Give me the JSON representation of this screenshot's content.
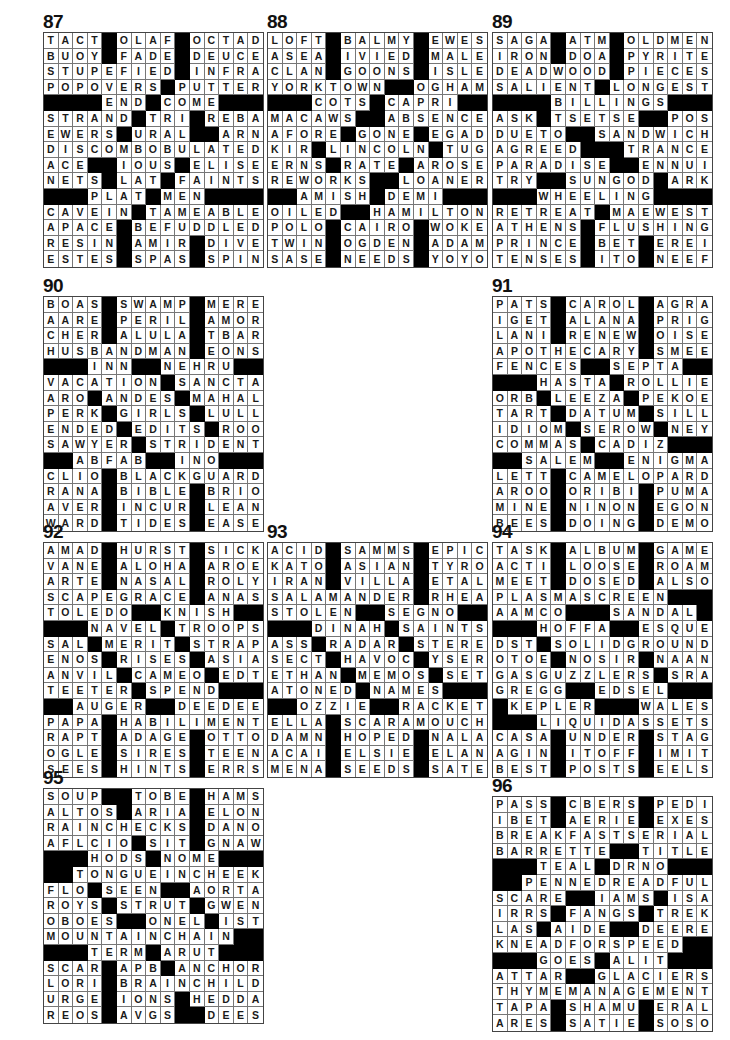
{
  "puzzles": [
    {
      "number": "87",
      "x": 43,
      "y": 12,
      "rows": [
        "TACT#OLAF#OCTAD",
        "BUOY#FADE#DEUCE",
        "STUPEFIED#INFRA",
        "POPOVERS#PUTTER",
        "####END#COME####",
        "STRAND#TRI#REBA",
        "EWERS#URAL##ARN",
        "DISCOMBOBULATED",
        "ACE##IOUS#ELISE",
        "NETS#LAT#FAINTS",
        "###PLAT#MEN####",
        "CAVEIN#TAMEABLE",
        "APACE#BEFUDDLED",
        "RESIN#AMIR#DIVE",
        "ESTES#SPAS#SPIN"
      ]
    },
    {
      "number": "88",
      "x": 267,
      "y": 12,
      "rows": [
        "LOFT#BALMY#EWES",
        "ASEA#IVIED#MALE",
        "CLAN#GOONS#ISLE",
        "YORKTOWN##OGHAM",
        "###COTS#CAPRI##",
        "MACAWS##ABSENCE",
        "AFORE#GONE#EGAD",
        "KIR#LINCOLN#TUG",
        "ERNS#RATE#AROSE",
        "REWORKS##LOANER",
        "##AMISH#DEMI###",
        "OILED##HAMILTON",
        "POLO#CAIRO#WOKE",
        "TWIN#OGDEN#ADAM",
        "SASE#NEEDS#YOYO"
      ]
    },
    {
      "number": "89",
      "x": 492,
      "y": 12,
      "rows": [
        "SAGA#ATM#OLDMEN",
        "IRON#DOA#PYRITE",
        "DEADWOOD#PIECES",
        "SALIENT#LONGEST",
        "####BILLINGS###",
        "ASK#TSETSE##POS",
        "DUETO##SANDWICH",
        "AGREED###TRANCE",
        "PARADISE##ENNUI",
        "TRY##SUNGOD#ARK",
        "###WHEELING####",
        "RETREAT#MAEWEST",
        "ATHENS#FLUSHING",
        "PRINCE#BET#EREI",
        "TENSES#ITO#NEEF"
      ]
    },
    {
      "number": "90",
      "x": 43,
      "y": 276,
      "rows": [
        "BOAS#SWAMP#MERE",
        "AARE#PERIL#AMOR",
        "CHER#ALULA#TBAR",
        "HUSBANDMAN#EONS",
        "###INN##NEHRU##",
        "VACATION#SANCTA",
        "ARO#ANDES#MAHAL",
        "PERK#GIRLS#LULL",
        "ENDED#EDITS#ROO",
        "SAWYER#STRIDENT",
        "##ABFAB##INO####",
        "CLIO#BLACKGUARD",
        "RANA#BIBLE#BRIO",
        "AVER#INCUR#LEAN",
        "WARD#TIDES#EASE"
      ]
    },
    {
      "number": "91",
      "x": 492,
      "y": 276,
      "rows": [
        "PATS#CAROL#AGRA",
        "IGET#ALANA#PRIG",
        "LANI#RENEW#OISE",
        "APOTHECARY#SMEE",
        "FENCES##SEPTA##",
        "###HASTA#ROLLIE",
        "ORB#LEEZA#PEKOE",
        "TART#DATUM#SILL",
        "IDIOM#SEROW#NEY",
        "COMMAS#CADIZ###",
        "##SALEM##ENIGMA",
        "LETT#CAMELOPARD",
        "AROO#ORIBI#PUMA",
        "MINE#NINON#EGON",
        "BEES#DOING#DEMO"
      ]
    },
    {
      "number": "92",
      "x": 43,
      "y": 522,
      "rows": [
        "AMAD#HURST#SICK",
        "VANE#ALOHA#AROE",
        "ARTE#NASAL#ROLY",
        "SCAPEGRACE#ANAS",
        "TOLEDO##KNISH##",
        "###NAVEL#TROOPS",
        "SAL#MERIT#STRAP",
        "ENOS#RISES#ASIA",
        "ANVIL#CAMEO#EDT",
        "TEETER#SPEND###",
        "##AUGER##DEEDEE",
        "PAPA#HABILIMENT",
        "RAPT#ADAGE#OTTO",
        "OGLE#SIRES#TEEN",
        "SEES#HINTS#ERRS"
      ]
    },
    {
      "number": "93",
      "x": 267,
      "y": 522,
      "rows": [
        "ACID#SAMMS#EPIC",
        "KATO#ASIAN#TYRO",
        "IRAN#VILLA#ETAL",
        "SALAMANDER#RHEA",
        "STOLEN##SEGNO##",
        "###DINAH#SAINTS",
        "ASS#RADAR#STERE",
        "SECT#HAVOC#YSER",
        "ETHAN#MEMOS#SET",
        "ATONED#NAMES###",
        "##OZZIE##RACKET",
        "ELLA#SCARAMOUCH",
        "DAMN#HOPED#NALA",
        "ACAI#ELSIE#ELAN",
        "MENA#SEEDS#SATE"
      ]
    },
    {
      "number": "94",
      "x": 492,
      "y": 522,
      "rows": [
        "TASK#ALBUM#GAME",
        "ACTI#LOOSE#ROAM",
        "MEET#DOSED#ALSO",
        "PLASMASCREEN###",
        "AAMCO###SANDAL#",
        "###HOFFA##ESQUE",
        "DST#SOLIDGROUND",
        "OTOE#NOSIR#NAAN",
        "GASGUZZLERS#SRA",
        "GREGG##EDSEL###",
        "#KEPLER###WALES",
        "###LIQUIDASSETS",
        "CASA#UNDER#STAG",
        "AGIN#ITOFF#IMIT",
        "BEST#POSTS#EELS"
      ]
    },
    {
      "number": "95",
      "x": 43,
      "y": 768,
      "rows": [
        "SOUP##TOBE#HAMS",
        "ALTOS#ARIA#ELON",
        "RAINCHECKS#DANO",
        "AFLCIO#SIT#GNAW",
        "###HODS#NOME###",
        "##TONGUEINCHEEK",
        "FLO#SEEN##AORTA",
        "ROYS#STRUT#GWEN",
        "OBOES##ONEL#IST",
        "MOUNTAINCHAIN##",
        "###TERM#ARUT###",
        "SCAR#APB#ANCHOR",
        "LORI#BRAINCHILD",
        "URGE#IONS#HEDDA",
        "REOS#AVGS##DEES"
      ]
    },
    {
      "number": "96",
      "x": 492,
      "y": 776,
      "rows": [
        "PASS#CBERS#PEDI",
        "IBET#AERIE#EXES",
        "BREAKFASTSERIAL",
        "BARRETTE##TITLE",
        "###TEAL#DRNO###",
        "##PENNEDREADFUL",
        "SCARE##IAMS#ISA",
        "IRRS#FANGS#TREK",
        "LAS#AIDE##DEERE",
        "KNEADFORSPEED##",
        "###GOES#ALIT###",
        "ATTAR##GLACIERS",
        "THYMEMANAGEMENT",
        "TAPA#SHAMU#ERAL",
        "ARES#SATIE#SOSO"
      ]
    }
  ]
}
